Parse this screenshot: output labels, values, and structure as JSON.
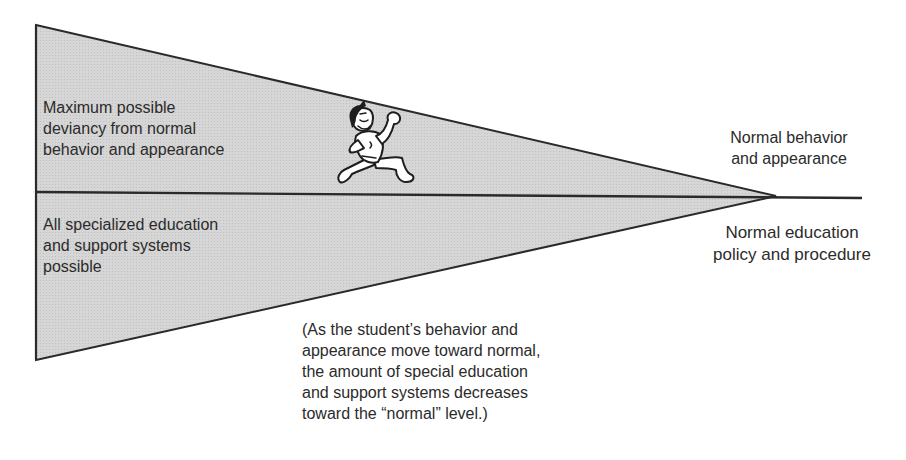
{
  "diagram": {
    "type": "funnel-wedge",
    "colors": {
      "fill": "#d3d3d3",
      "stroke": "#2a2a2a",
      "text": "#2b2b2b",
      "background": "#ffffff"
    },
    "labels": {
      "top_left": "Maximum possible\ndeviancy from normal\nbehavior and appearance",
      "bottom_left": "All specialized education\nand support systems\npossible",
      "top_right": "Normal behavior\nand appearance",
      "bottom_right": "Normal education\npolicy and procedure",
      "note": "(As the student’s behavior and\nappearance move toward normal,\nthe amount of special education\nand support systems decreases\ntoward the “normal” level.)"
    },
    "illustration": {
      "icon": "running-student-cartoon-icon"
    }
  }
}
